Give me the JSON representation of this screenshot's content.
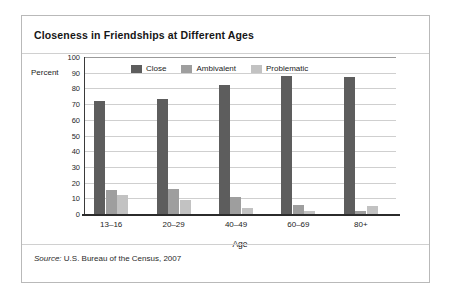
{
  "figure": {
    "title": "Closeness in Friendships at Different Ages",
    "source_word": "Source:",
    "source_text": " U.S. Bureau of the Census, 2007"
  },
  "colors": {
    "close": "#5d5d5d",
    "ambivalent": "#9e9e9e",
    "problematic": "#c2c2c2",
    "grid": "#cfcfcf",
    "axis": "#2b2b2b",
    "card_border": "#b9b9b9"
  },
  "chart_data": {
    "type": "bar",
    "title": "Closeness in Friendships at Different Ages",
    "xlabel": "Age",
    "ylabel": "Percent",
    "ylim": [
      0,
      100
    ],
    "ytick_step": 10,
    "yticks": [
      100,
      90,
      80,
      70,
      60,
      50,
      40,
      30,
      20,
      10,
      0
    ],
    "grid": true,
    "legend_position": "top-left-inside",
    "categories": [
      "13–16",
      "20–29",
      "40–49",
      "60–69",
      "80+"
    ],
    "series": [
      {
        "name": "Close",
        "values": [
          72,
          73,
          82,
          88,
          87
        ]
      },
      {
        "name": "Ambivalent",
        "values": [
          15,
          16,
          11,
          6,
          2
        ]
      },
      {
        "name": "Problematic",
        "values": [
          12,
          9,
          4,
          2,
          5
        ]
      }
    ],
    "annotations": [
      "Source: U.S. Bureau of the Census, 2007"
    ]
  }
}
